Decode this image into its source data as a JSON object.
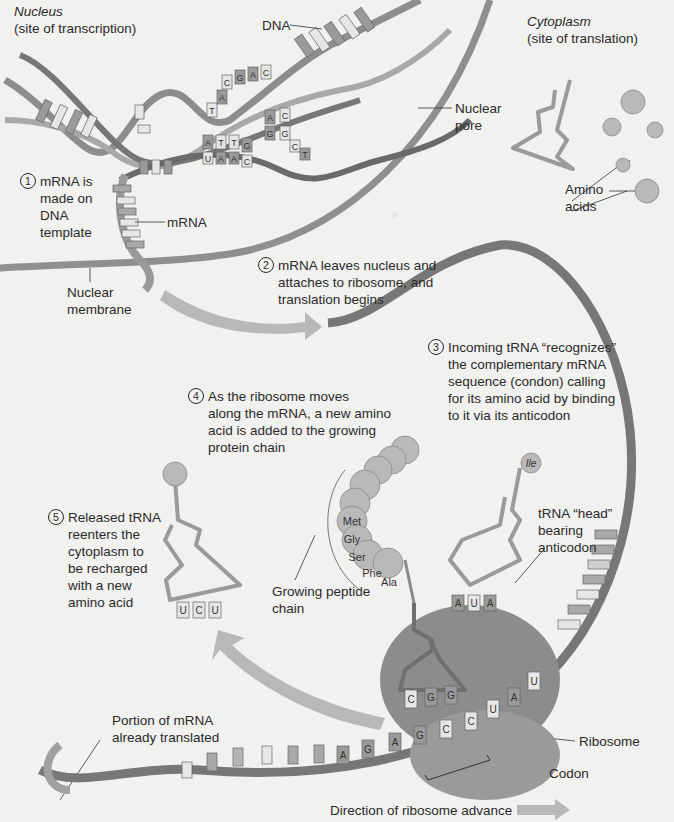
{
  "regions": {
    "nucleus": {
      "title": "Nucleus",
      "subtitle": "(site of transcription)"
    },
    "cytoplasm": {
      "title": "Cytoplasm",
      "subtitle": "(site of translation)"
    }
  },
  "labels": {
    "dna": "DNA",
    "nuclear_pore": "Nuclear\npore",
    "amino_acids": "Amino\nacids",
    "mrna": "mRNA",
    "nuclear_membrane": "Nuclear\nmembrane",
    "growing_peptide": "Growing peptide\nchain",
    "trna_head": "tRNA “head”\nbearing\nanticodon",
    "portion_translated": "Portion of mRNA\nalready translated",
    "ribosome": "Ribosome",
    "codon": "Codon",
    "direction": "Direction of ribosome advance"
  },
  "steps": [
    {
      "num": "1",
      "text": "mRNA is\nmade on\nDNA\ntemplate"
    },
    {
      "num": "2",
      "text": "mRNA leaves nucleus and\nattaches to ribosome, and\ntranslation begins"
    },
    {
      "num": "3",
      "text": "Incoming tRNA “recognizes”\nthe complementary mRNA\nsequence (condon) calling\nfor its amino acid by binding\nto it via its anticodon"
    },
    {
      "num": "4",
      "text": "As the ribosome moves\nalong the mRNA, a new amino\nacid is added to the growing\nprotein chain"
    },
    {
      "num": "5",
      "text": "Released tRNA\nreenters the\ncytoplasm to\nbe recharged\nwith a new\namino acid"
    }
  ],
  "peptide_chain": [
    "Met",
    "Gly",
    "Ser",
    "Phe",
    "Ala"
  ],
  "incoming_amino_acid": "Ile",
  "released_trna_anticodon": [
    "U",
    "C",
    "U"
  ],
  "incoming_trna_anticodon": [
    "A",
    "U",
    "A"
  ],
  "bound_trna_anticodon": [
    "C",
    "G",
    "G"
  ],
  "mrna_bases_in_ribosome": [
    "A",
    "G",
    "A",
    "G",
    "C",
    "C",
    "U",
    "A",
    "U"
  ],
  "dna_bases": {
    "upper": [
      "T",
      "A",
      "C",
      "G",
      "A",
      "C"
    ],
    "middle": [
      "A",
      "C",
      "G",
      "C",
      "T",
      "G"
    ],
    "lower": [
      "A",
      "T",
      "T",
      "G",
      "U",
      "A",
      "A",
      "C"
    ]
  },
  "colors": {
    "background": "#f1f1ef",
    "strand_dark": "#6e6e6e",
    "strand_mid": "#8f8f8f",
    "strand_light": "#b5b5b5",
    "ribosome": "#8c8c8c",
    "amino_acid": "#b9b9b9",
    "arrow": "#b8b8b8",
    "base_light": "#e8e8e6"
  }
}
